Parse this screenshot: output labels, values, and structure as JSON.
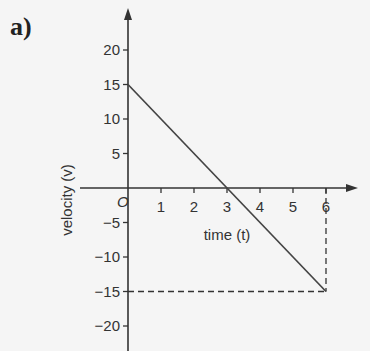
{
  "panel_label": "a)",
  "chart_data": {
    "type": "line",
    "title": "",
    "xlabel": "time (t)",
    "ylabel": "velocity (v)",
    "origin_label": "O",
    "x_ticks": [
      1,
      2,
      3,
      4,
      5,
      6
    ],
    "y_ticks": [
      20,
      15,
      10,
      5,
      -5,
      -10,
      -15,
      -20
    ],
    "xlim": [
      0,
      6
    ],
    "ylim": [
      -20,
      20
    ],
    "grid": false,
    "series": [
      {
        "name": "velocity",
        "x": [
          0,
          6
        ],
        "y": [
          15,
          -15
        ]
      }
    ],
    "annotations": [
      {
        "type": "dashed-line",
        "from": [
          6,
          0
        ],
        "to": [
          6,
          -15
        ]
      },
      {
        "type": "dashed-line",
        "from": [
          0,
          -15
        ],
        "to": [
          6,
          -15
        ]
      }
    ]
  }
}
